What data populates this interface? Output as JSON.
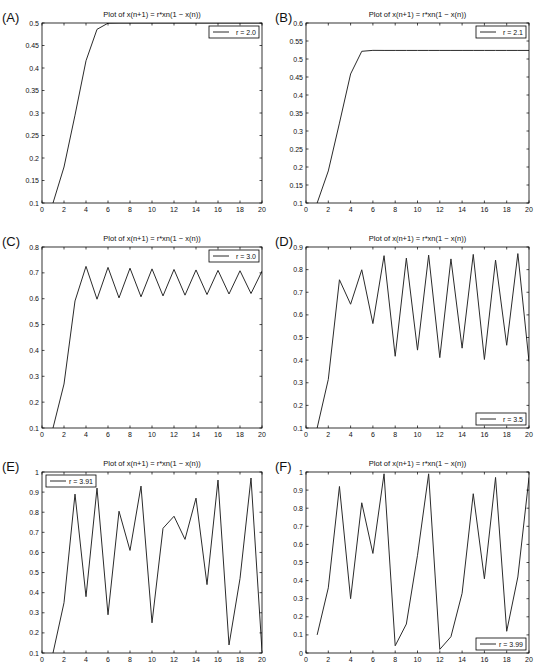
{
  "figure": {
    "panels": [
      "A",
      "B",
      "C",
      "D",
      "E",
      "F"
    ]
  },
  "chart_data": [
    {
      "panel_label": "(A)",
      "type": "line",
      "title": "Plot of x(n+1) = r*xn(1 − x(n))",
      "xlabel": "",
      "ylabel": "",
      "xlim": [
        0,
        20
      ],
      "ylim": [
        0.1,
        0.5
      ],
      "xticks": [
        0,
        2,
        4,
        6,
        8,
        10,
        12,
        14,
        16,
        18,
        20
      ],
      "yticks": [
        0.1,
        0.15,
        0.2,
        0.25,
        0.3,
        0.35,
        0.4,
        0.45,
        0.5
      ],
      "ytick_labels": [
        "0.1",
        "0.15",
        "0.2",
        "0.25",
        "0.3",
        "0.35",
        "0.4",
        "0.45",
        "0.5"
      ],
      "grid": false,
      "legend": {
        "label": "r = 2.0",
        "position": "upper right"
      },
      "series": [
        {
          "name": "r = 2.0",
          "x": [
            1,
            2,
            3,
            4,
            5,
            6,
            7,
            8,
            9,
            10,
            11,
            12,
            13,
            14,
            15,
            16,
            17,
            18,
            19,
            20
          ],
          "values": [
            0.1,
            0.18,
            0.2952,
            0.4161,
            0.4859,
            0.4996,
            0.5,
            0.5,
            0.5,
            0.5,
            0.5,
            0.5,
            0.5,
            0.5,
            0.5,
            0.5,
            0.5,
            0.5,
            0.5,
            0.5
          ]
        }
      ]
    },
    {
      "panel_label": "(B)",
      "type": "line",
      "title": "Plot of x(n+1) = r*xn(1 − x(n))",
      "xlabel": "",
      "ylabel": "",
      "xlim": [
        0,
        20
      ],
      "ylim": [
        0.1,
        0.6
      ],
      "xticks": [
        0,
        2,
        4,
        6,
        8,
        10,
        12,
        14,
        16,
        18,
        20
      ],
      "yticks": [
        0.1,
        0.15,
        0.2,
        0.25,
        0.3,
        0.35,
        0.4,
        0.45,
        0.5,
        0.55,
        0.6
      ],
      "ytick_labels": [
        "0.1",
        "0.15",
        "0.2",
        "0.25",
        "0.3",
        "0.35",
        "0.4",
        "0.45",
        "0.5",
        "0.55",
        "0.6"
      ],
      "grid": false,
      "legend": {
        "label": "r = 2.1",
        "position": "upper right"
      },
      "series": [
        {
          "name": "r = 2.1",
          "x": [
            1,
            2,
            3,
            4,
            5,
            6,
            7,
            8,
            9,
            10,
            11,
            12,
            13,
            14,
            15,
            16,
            17,
            18,
            19,
            20
          ],
          "values": [
            0.1,
            0.189,
            0.3219,
            0.4584,
            0.5214,
            0.524,
            0.5238,
            0.5238,
            0.5238,
            0.5238,
            0.5238,
            0.5238,
            0.5238,
            0.5238,
            0.5238,
            0.5238,
            0.5238,
            0.5238,
            0.5238,
            0.5238
          ]
        }
      ]
    },
    {
      "panel_label": "(C)",
      "type": "line",
      "title": "Plot of x(n+1) = r*xn(1 − x(n))",
      "xlabel": "",
      "ylabel": "",
      "xlim": [
        0,
        20
      ],
      "ylim": [
        0.1,
        0.8
      ],
      "xticks": [
        0,
        2,
        4,
        6,
        8,
        10,
        12,
        14,
        16,
        18,
        20
      ],
      "yticks": [
        0.1,
        0.2,
        0.3,
        0.4,
        0.5,
        0.6,
        0.7,
        0.8
      ],
      "ytick_labels": [
        "0.1",
        "0.2",
        "0.3",
        "0.4",
        "0.5",
        "0.6",
        "0.7",
        "0.8"
      ],
      "grid": false,
      "legend": {
        "label": "r = 3.0",
        "position": "upper right"
      },
      "series": [
        {
          "name": "r = 3.0",
          "x": [
            1,
            2,
            3,
            4,
            5,
            6,
            7,
            8,
            9,
            10,
            11,
            12,
            13,
            14,
            15,
            16,
            17,
            18,
            19,
            20
          ],
          "values": [
            0.1,
            0.27,
            0.5913,
            0.725,
            0.5981,
            0.7211,
            0.6033,
            0.718,
            0.6074,
            0.7154,
            0.6108,
            0.7132,
            0.6137,
            0.7113,
            0.6161,
            0.7096,
            0.6182,
            0.7081,
            0.6201,
            0.7067
          ]
        }
      ]
    },
    {
      "panel_label": "(D)",
      "type": "line",
      "title": "Plot of x(n+1) = r*xn(1 − x(n))",
      "xlabel": "",
      "ylabel": "",
      "xlim": [
        0,
        20
      ],
      "ylim": [
        0.1,
        0.9
      ],
      "xticks": [
        0,
        2,
        4,
        6,
        8,
        10,
        12,
        14,
        16,
        18,
        20
      ],
      "yticks": [
        0.1,
        0.2,
        0.3,
        0.4,
        0.5,
        0.6,
        0.7,
        0.8,
        0.9
      ],
      "ytick_labels": [
        "0.1",
        "0.2",
        "0.3",
        "0.4",
        "0.5",
        "0.6",
        "0.7",
        "0.8",
        "0.9"
      ],
      "grid": false,
      "legend": {
        "label": "r = 3.5",
        "position": "lower right"
      },
      "series": [
        {
          "name": "r = 3.5",
          "x": [
            1,
            2,
            3,
            4,
            5,
            6,
            7,
            8,
            9,
            10,
            11,
            12,
            13,
            14,
            15,
            16,
            17,
            18,
            19,
            20
          ],
          "values": [
            0.1,
            0.315,
            0.7552,
            0.6471,
            0.7993,
            0.5615,
            0.8617,
            0.417,
            0.8508,
            0.4442,
            0.8641,
            0.411,
            0.8473,
            0.4529,
            0.8673,
            0.4028,
            0.842,
            0.4657,
            0.8709,
            0.3936
          ]
        }
      ]
    },
    {
      "panel_label": "(E)",
      "type": "line",
      "title": "Plot of x(n+1) = r*xn(1 − x(n))",
      "xlabel": "",
      "ylabel": "",
      "xlim": [
        0,
        20
      ],
      "ylim": [
        0.1,
        1.0
      ],
      "xticks": [
        0,
        2,
        4,
        6,
        8,
        10,
        12,
        14,
        16,
        18,
        20
      ],
      "yticks": [
        0.1,
        0.2,
        0.3,
        0.4,
        0.5,
        0.6,
        0.7,
        0.8,
        0.9,
        1.0
      ],
      "ytick_labels": [
        "0.1",
        "0.2",
        "0.3",
        "0.4",
        "0.5",
        "0.6",
        "0.7",
        "0.8",
        "0.9",
        "1"
      ],
      "grid": false,
      "legend": {
        "label": "r = 3.91",
        "position": "upper left"
      },
      "series": [
        {
          "name": "r = 3.91",
          "x": [
            1,
            2,
            3,
            4,
            5,
            6,
            7,
            8,
            9,
            10,
            11,
            12,
            13,
            14,
            15,
            16,
            17,
            18,
            19,
            20
          ],
          "values": [
            0.1,
            0.35,
            0.89,
            0.38,
            0.92,
            0.29,
            0.805,
            0.61,
            0.93,
            0.25,
            0.72,
            0.78,
            0.665,
            0.87,
            0.44,
            0.96,
            0.14,
            0.47,
            0.97,
            0.11
          ]
        }
      ]
    },
    {
      "panel_label": "(F)",
      "type": "line",
      "title": "Plot of x(n+1) = r*xn(1 − x(n))",
      "xlabel": "",
      "ylabel": "",
      "xlim": [
        0,
        20
      ],
      "ylim": [
        0,
        1.0
      ],
      "xticks": [
        0,
        2,
        4,
        6,
        8,
        10,
        12,
        14,
        16,
        18,
        20
      ],
      "yticks": [
        0,
        0.1,
        0.2,
        0.3,
        0.4,
        0.5,
        0.6,
        0.7,
        0.8,
        0.9,
        1.0
      ],
      "ytick_labels": [
        "0",
        "0.1",
        "0.2",
        "0.3",
        "0.4",
        "0.5",
        "0.6",
        "0.7",
        "0.8",
        "0.9",
        "1"
      ],
      "grid": false,
      "legend": {
        "label": "r = 3.99",
        "position": "lower right"
      },
      "series": [
        {
          "name": "r = 3.99",
          "x": [
            1,
            2,
            3,
            4,
            5,
            6,
            7,
            8,
            9,
            10,
            11,
            12,
            13,
            14,
            15,
            16,
            17,
            18,
            19,
            20
          ],
          "values": [
            0.1,
            0.36,
            0.92,
            0.3,
            0.83,
            0.55,
            0.99,
            0.04,
            0.16,
            0.54,
            0.99,
            0.02,
            0.09,
            0.33,
            0.88,
            0.41,
            0.97,
            0.12,
            0.42,
            0.97
          ]
        }
      ]
    }
  ],
  "layout": {
    "axes": [
      {
        "left": 42,
        "top": 23,
        "right": 262,
        "bottom": 203
      },
      {
        "left": 306,
        "top": 23,
        "right": 529,
        "bottom": 203
      },
      {
        "left": 42,
        "top": 247,
        "right": 262,
        "bottom": 428
      },
      {
        "left": 306,
        "top": 247,
        "right": 529,
        "bottom": 428
      },
      {
        "left": 42,
        "top": 472,
        "right": 262,
        "bottom": 653
      },
      {
        "left": 306,
        "top": 472,
        "right": 529,
        "bottom": 653
      }
    ],
    "label_offsets": [
      {
        "x": 2,
        "y": 22
      },
      {
        "x": 275,
        "y": 22
      },
      {
        "x": 2,
        "y": 246
      },
      {
        "x": 275,
        "y": 246
      },
      {
        "x": 2,
        "y": 471
      },
      {
        "x": 275,
        "y": 471
      }
    ]
  },
  "colors": {
    "line": "#2b2b2b",
    "axis": "#000000",
    "text": "#111111",
    "background": "#ffffff"
  }
}
